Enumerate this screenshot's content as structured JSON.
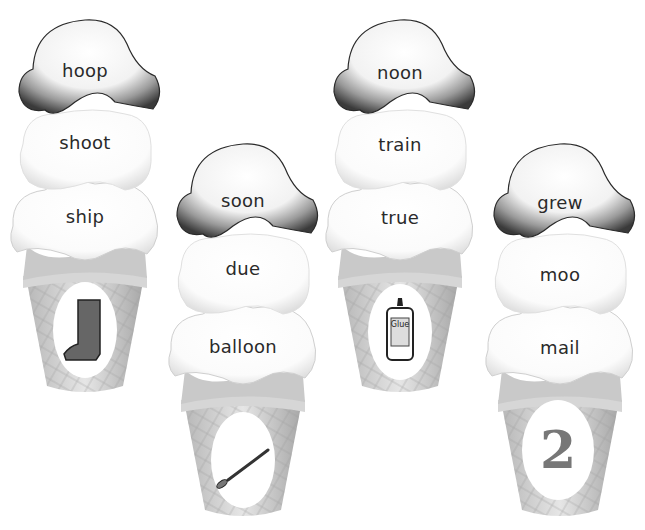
{
  "worksheet": {
    "cones": [
      {
        "scoops": [
          "hoop",
          "shoot",
          "ship"
        ],
        "picture": "boot-icon"
      },
      {
        "scoops": [
          "soon",
          "due",
          "balloon"
        ],
        "picture": "spoon-icon"
      },
      {
        "scoops": [
          "noon",
          "train",
          "true"
        ],
        "picture": "glue-bottle-icon",
        "picture_label": "Glue"
      },
      {
        "scoops": [
          "grew",
          "moo",
          "mail"
        ],
        "picture": "number",
        "picture_label": "2"
      }
    ]
  }
}
